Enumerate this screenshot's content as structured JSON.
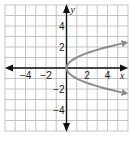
{
  "chart_data": {
    "type": "line",
    "title": "",
    "xlabel": "x",
    "ylabel": "y",
    "xlim": [
      -6,
      6
    ],
    "ylim": [
      -6,
      6
    ],
    "grid": true,
    "grid_step": 1,
    "x_tick_labels": [
      "−4",
      "−2",
      "2",
      "4"
    ],
    "x_tick_values": [
      -4,
      -2,
      2,
      4
    ],
    "y_tick_labels": [
      "4",
      "2",
      "−2",
      "−4"
    ],
    "y_tick_values": [
      4,
      2,
      -2,
      -4
    ],
    "series": [
      {
        "name": "upper branch",
        "equation": "y = √x",
        "x": [
          0,
          0.25,
          0.5,
          1,
          2,
          3,
          4,
          5,
          6
        ],
        "y": [
          0,
          0.5,
          0.71,
          1,
          1.41,
          1.73,
          2,
          2.24,
          2.45
        ],
        "arrow_end": true
      },
      {
        "name": "lower branch",
        "equation": "y = −√x",
        "x": [
          0,
          0.25,
          0.5,
          1,
          2,
          3,
          4,
          5,
          6
        ],
        "y": [
          0,
          -0.5,
          -0.71,
          -1,
          -1.41,
          -1.73,
          -2,
          -2.24,
          -2.45
        ],
        "arrow_end": true
      }
    ],
    "colors": {
      "grid": "#b8b8b8",
      "axes": "#111111",
      "curve": "#8c8c8c"
    }
  }
}
